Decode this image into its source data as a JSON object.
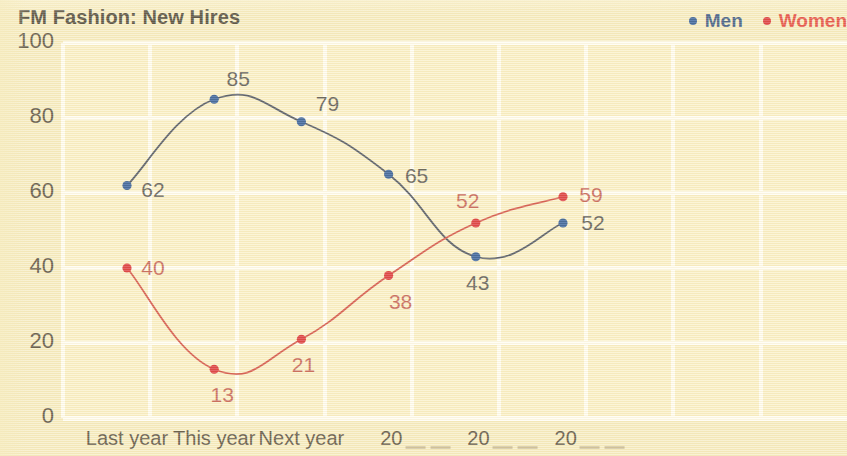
{
  "chart_data": {
    "type": "line",
    "title": "FM Fashion: New Hires",
    "xlabel": "",
    "ylabel": "",
    "categories": [
      "Last year",
      "This year",
      "Next year",
      "20",
      "20",
      "20"
    ],
    "category_notes": [
      "",
      "",
      "",
      "partially cropped year",
      "partially cropped year",
      "partially cropped year"
    ],
    "series": [
      {
        "name": "Men",
        "color": "#1f4e93",
        "values": [
          62,
          85,
          79,
          65,
          43,
          52
        ]
      },
      {
        "name": "Women",
        "color": "#d8232a",
        "values": [
          40,
          13,
          21,
          38,
          52,
          59
        ]
      }
    ],
    "ylim": [
      0,
      100
    ],
    "yticks": [
      0,
      20,
      40,
      60,
      80,
      100
    ],
    "grid": true,
    "legend_position": "top-right"
  },
  "legend": {
    "entries": [
      {
        "label": "Men",
        "color": "#2b4a7d",
        "dot_color": "#1f4e93",
        "icon": "dot-icon"
      },
      {
        "label": "Women",
        "color": "#e23a32",
        "dot_color": "#d8232a",
        "icon": "dot-icon"
      }
    ]
  },
  "axes": {
    "y_labels": [
      "100",
      "80",
      "60",
      "40",
      "20",
      "0"
    ],
    "x_labels": [
      "Last year",
      "This year",
      "Next year",
      "20",
      "20",
      "20"
    ]
  },
  "data_labels": {
    "men": [
      "62",
      "85",
      "79",
      "65",
      "43",
      "52"
    ],
    "women": [
      "40",
      "13",
      "21",
      "38",
      "52",
      "59"
    ]
  },
  "colors": {
    "background": "#f6ecc0",
    "plot_background": "#faf0c6",
    "gridline": "#fffdf2",
    "men_line": "#3c4455",
    "men_marker": "#1f4e93",
    "women_line": "#cf4238",
    "women_marker": "#d8232a",
    "title_text": "#3b352a",
    "tick_text": "#4a4133"
  }
}
